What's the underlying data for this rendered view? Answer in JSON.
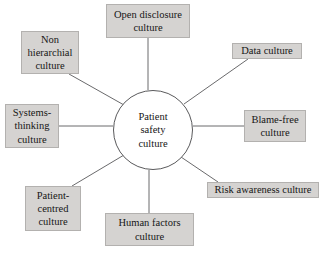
{
  "diagram": {
    "type": "radial-hub-and-spoke",
    "background_color": "#ffffff",
    "node_fill_color": "#d5d3d1",
    "node_border_color": "#b3b1af",
    "line_color": "#6a6a6c",
    "text_color": "#161616",
    "hub": {
      "label": "Patient safety culture",
      "lines": [
        "Patient",
        "safety",
        "culture"
      ],
      "center_x": 153,
      "center_y": 130,
      "radius": 40
    },
    "nodes": [
      {
        "id": "open-disclosure-culture",
        "label": "Open disclosure culture",
        "lines": [
          "Open disclosure",
          "culture"
        ],
        "x": 106,
        "y": 4,
        "width": 84,
        "height": 34,
        "font_size": 10.5,
        "connector": {
          "x1": 148,
          "y1": 38,
          "x2": 148,
          "y2": 90
        }
      },
      {
        "id": "data-culture",
        "label": "Data culture",
        "lines": [
          "Data culture"
        ],
        "x": 232,
        "y": 43,
        "width": 70,
        "height": 16,
        "font_size": 10.5,
        "connector": {
          "x1": 248,
          "y1": 59,
          "x2": 184,
          "y2": 104
        }
      },
      {
        "id": "blame-free-culture",
        "label": "Blame-free culture",
        "lines": [
          "Blame-free",
          "culture"
        ],
        "x": 244,
        "y": 110,
        "width": 62,
        "height": 32,
        "font_size": 10.5,
        "connector": {
          "x1": 244,
          "y1": 126,
          "x2": 193,
          "y2": 126
        }
      },
      {
        "id": "risk-awareness-culture",
        "label": "Risk awareness culture",
        "lines": [
          "Risk awareness culture"
        ],
        "x": 207,
        "y": 182,
        "width": 112,
        "height": 16,
        "font_size": 10.5,
        "connector": {
          "x1": 218,
          "y1": 182,
          "x2": 181,
          "y2": 157
        }
      },
      {
        "id": "human-factors-culture",
        "label": "Human factors culture",
        "lines": [
          "Human factors",
          "culture"
        ],
        "x": 105,
        "y": 213,
        "width": 89,
        "height": 33,
        "font_size": 10.5,
        "connector": {
          "x1": 149,
          "y1": 213,
          "x2": 149,
          "y2": 170
        }
      },
      {
        "id": "patient-centred-culture",
        "label": "Patient-centred culture",
        "lines": [
          "Patient-",
          "centred",
          "culture"
        ],
        "x": 25,
        "y": 186,
        "width": 56,
        "height": 45,
        "font_size": 10.5,
        "connector": {
          "x1": 72,
          "y1": 186,
          "x2": 124,
          "y2": 155
        }
      },
      {
        "id": "systems-thinking-culture",
        "label": "Systems-thinking culture",
        "lines": [
          "Systems-",
          "thinking",
          "culture"
        ],
        "x": 5,
        "y": 104,
        "width": 54,
        "height": 44,
        "font_size": 10.5,
        "connector": {
          "x1": 59,
          "y1": 126,
          "x2": 113,
          "y2": 126
        }
      },
      {
        "id": "non-hierarchial-culture",
        "label": "Non hierarchial culture",
        "lines": [
          "Non",
          "hierarchial",
          "culture"
        ],
        "x": 21,
        "y": 31,
        "width": 58,
        "height": 43,
        "font_size": 10.5,
        "connector": {
          "x1": 69,
          "y1": 74,
          "x2": 124,
          "y2": 105
        }
      }
    ]
  }
}
